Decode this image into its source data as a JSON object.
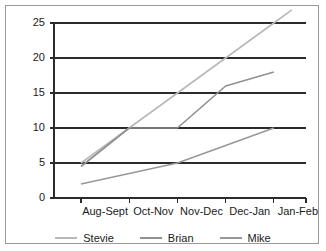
{
  "chart_data": {
    "type": "line",
    "title": "",
    "xlabel": "",
    "ylabel": "",
    "categories": [
      "Aug-Sept",
      "Oct-Nov",
      "Nov-Dec",
      "Dec-Jan",
      "Jan-Feb"
    ],
    "ylim": [
      0,
      25
    ],
    "ytick_labels": [
      "0",
      "5",
      "10",
      "15",
      "20",
      "25"
    ],
    "ytick_values": [
      0,
      5,
      10,
      15,
      20,
      25
    ],
    "grid": true,
    "legend_position": "bottom",
    "series": [
      {
        "name": "Stevie",
        "color": "#b8b8b8",
        "values": [
          5,
          10,
          15,
          20,
          25
        ],
        "overshoot_end": 26.5
      },
      {
        "name": "Brian",
        "color": "#909090",
        "values": [
          4.5,
          10,
          10,
          16,
          18
        ]
      },
      {
        "name": "Mike",
        "color": "#989898",
        "values": [
          2,
          3.5,
          5,
          7.5,
          10
        ]
      }
    ]
  },
  "axes": {
    "axis_color": "#2b2b2b",
    "grid_color": "#2b2b2b",
    "label_color": "#1a1a1a"
  },
  "legend": {
    "entries": [
      {
        "label": "Stevie",
        "color": "#b8b8b8"
      },
      {
        "label": "Brian",
        "color": "#909090"
      },
      {
        "label": "Mike",
        "color": "#989898"
      }
    ]
  },
  "frame": {
    "border_color": "#9a9a9a",
    "background": "#ffffff"
  }
}
